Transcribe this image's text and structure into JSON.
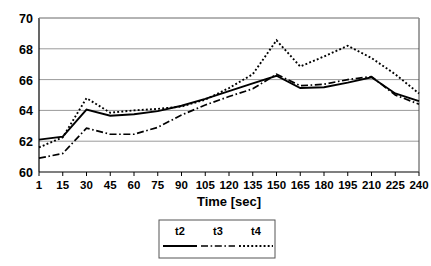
{
  "chart_data": {
    "type": "line",
    "title": "",
    "xlabel": "Time [sec]",
    "ylabel": "",
    "x": [
      1,
      15,
      30,
      45,
      60,
      75,
      90,
      105,
      120,
      135,
      150,
      165,
      180,
      195,
      210,
      225,
      240
    ],
    "categories": [
      "1",
      "15",
      "30",
      "45",
      "60",
      "75",
      "90",
      "105",
      "120",
      "135",
      "150",
      "165",
      "180",
      "195",
      "210",
      "225",
      "240"
    ],
    "xtick_labels": [
      "1",
      "15",
      "30",
      "45",
      "60",
      "75",
      "90",
      "105",
      "120",
      "135",
      "150",
      "165",
      "180",
      "195",
      "210",
      "225",
      "240"
    ],
    "ytick_labels": [
      "60",
      "62",
      "64",
      "66",
      "68",
      "70"
    ],
    "yticks": [
      60,
      62,
      64,
      66,
      68,
      70
    ],
    "ylim": [
      60,
      70
    ],
    "grid": true,
    "grid_axis": "y",
    "legend_position": "bottom",
    "series": [
      {
        "name": "t2",
        "style": "solid",
        "values": [
          62.1,
          62.3,
          64.05,
          63.65,
          63.75,
          63.95,
          64.3,
          64.75,
          65.25,
          65.75,
          66.25,
          65.45,
          65.5,
          65.8,
          66.15,
          65.1,
          64.6
        ]
      },
      {
        "name": "t3",
        "style": "dash-dot",
        "values": [
          60.9,
          61.2,
          62.85,
          62.45,
          62.45,
          62.9,
          63.7,
          64.35,
          64.9,
          65.4,
          66.35,
          65.6,
          65.7,
          66.0,
          66.2,
          65.0,
          64.4
        ]
      },
      {
        "name": "t4",
        "style": "dotted",
        "values": [
          61.6,
          62.25,
          64.8,
          63.85,
          64.0,
          64.1,
          64.25,
          64.7,
          65.45,
          66.35,
          68.55,
          66.85,
          67.5,
          68.2,
          67.4,
          66.35,
          65.1
        ]
      }
    ]
  },
  "axis": {
    "x_title": "Time [sec]"
  },
  "legend": {
    "entries": [
      {
        "label": "t2",
        "style": "solid"
      },
      {
        "label": "t3",
        "style": "dash-dot"
      },
      {
        "label": "t4",
        "style": "dotted"
      }
    ]
  }
}
